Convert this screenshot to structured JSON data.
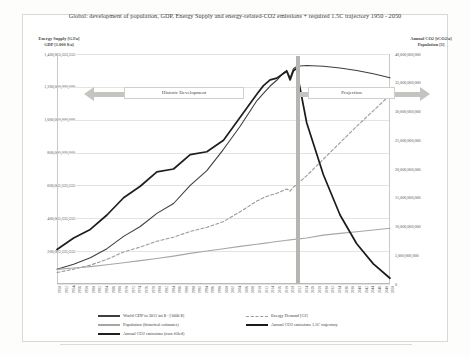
{
  "figure": {
    "title": "Global: development of population, GDP, Energy Supply and energy-related-CO2 emissions + required 1.5C trajectory 1950 - 2050",
    "axis_title_left": "Energy Supply [GJ/a]\nGDP [1.000 $/a]",
    "axis_title_left_line1": "Energy Supply [GJ/a]",
    "axis_title_left_line2": "GDP [1.000 $/a]",
    "axis_title_right_line1": "Annual CO2 [tCO2/a]",
    "axis_title_right_line2": "Population [1]"
  },
  "annotations": [
    {
      "name": "historic-development",
      "label": "Historic Development",
      "arrow": "left"
    },
    {
      "name": "projection",
      "label": "Projection",
      "arrow": "right"
    }
  ],
  "legend": {
    "items": [
      {
        "label": "World GDP in 2011 int $ - [1000 $]",
        "color": "#3f3f3f",
        "style": "solid",
        "column": 0
      },
      {
        "label": "Population (historical estimates)",
        "color": "#a6a6a3",
        "style": "solid",
        "column": 0
      },
      {
        "label": "Annual CO2 emissions (own filled)",
        "color": "#1e1e1e",
        "style": "thick",
        "column": 0
      },
      {
        "label": "Energy Demand [GJ]",
        "color": "#9a9a97",
        "style": "dashed",
        "column": 1
      },
      {
        "label": "Annual CO2 emissions 1.5C trajectory",
        "color": "#1a1a1a",
        "style": "thick",
        "column": 1
      }
    ]
  },
  "chart_data": {
    "type": "line",
    "title": "Global: development of population, GDP, Energy Supply and energy-related-CO2 emissions + required 1.5C trajectory 1950 - 2050",
    "xlabel": "",
    "ylabel": "Energy Supply [GJ/a] / GDP [1.000 $/a]",
    "y2label": "Annual CO2 [tCO2/a] / Population [1]",
    "grid": true,
    "legend_position": "bottom",
    "xlim": [
      1950,
      2050
    ],
    "ylim": [
      0,
      1400000000000
    ],
    "y2lim": [
      0,
      40000000000
    ],
    "ytick_labels": [
      "0",
      "200,000,000,000",
      "400,000,000,000",
      "600,000,000,000",
      "800,000,000,000",
      "1,000,000,000,000",
      "1,200,000,000,000",
      "1,400,000,000,000"
    ],
    "y2tick_labels": [
      "0",
      "5,000,000,000",
      "10,000,000,000",
      "15,000,000,000",
      "20,000,000,000",
      "25,000,000,000",
      "30,000,000,000",
      "35,000,000,000",
      "40,000,000,000"
    ],
    "xtick_labels": [
      "1950",
      "1952",
      "1954",
      "1956",
      "1958",
      "1960",
      "1962",
      "1964",
      "1966",
      "1968",
      "1970",
      "1972",
      "1974",
      "1976",
      "1978",
      "1980",
      "1982",
      "1984",
      "1986",
      "1988",
      "1990",
      "1992",
      "1994",
      "1996",
      "1998",
      "2000",
      "2002",
      "2004",
      "2006",
      "2008",
      "2010",
      "2012",
      "2014",
      "2016",
      "2018",
      "2020",
      "2022",
      "2024",
      "2026",
      "2028",
      "2030",
      "2032",
      "2034",
      "2036",
      "2038",
      "2040",
      "2042",
      "2044",
      "2046",
      "2048",
      "2050"
    ],
    "marker_year": 2020,
    "x": [
      1950,
      1955,
      1960,
      1965,
      1970,
      1975,
      1980,
      1985,
      1990,
      1995,
      2000,
      2005,
      2010,
      2012,
      2014,
      2016,
      2018,
      2019,
      2020,
      2021,
      2022,
      2025,
      2030,
      2035,
      2040,
      2045,
      2050
    ],
    "series": [
      {
        "name": "World GDP in 2011 int $ - [1000 $]",
        "axis": "left",
        "color": "#3f3f3f",
        "style": "solid",
        "values": [
          90000000000,
          120000000000,
          160000000000,
          215000000000,
          290000000000,
          350000000000,
          430000000000,
          490000000000,
          600000000000,
          690000000000,
          820000000000,
          960000000000,
          1115000000000,
          1160000000000,
          1205000000000,
          1240000000000,
          1285000000000,
          1300000000000,
          1255000000000,
          1310000000000,
          1325000000000,
          1330000000000,
          1325000000000,
          1315000000000,
          1300000000000,
          1280000000000,
          1255000000000
        ]
      },
      {
        "name": "Energy Demand [GJ]",
        "axis": "left",
        "color": "#9a9a97",
        "style": "dashed",
        "values": [
          70000000000,
          90000000000,
          115000000000,
          150000000000,
          195000000000,
          225000000000,
          260000000000,
          285000000000,
          320000000000,
          345000000000,
          380000000000,
          440000000000,
          505000000000,
          525000000000,
          540000000000,
          552000000000,
          570000000000,
          578000000000,
          565000000000,
          590000000000,
          605000000000,
          660000000000,
          760000000000,
          860000000000,
          960000000000,
          1055000000000,
          1150000000000
        ]
      },
      {
        "name": "Population (historical estimates)",
        "axis": "right",
        "color": "#a6a6a3",
        "style": "solid",
        "values": [
          2540000000,
          2770000000,
          3030000000,
          3340000000,
          3700000000,
          4070000000,
          4440000000,
          4850000000,
          5320000000,
          5740000000,
          6140000000,
          6540000000,
          6920000000,
          7070000000,
          7230000000,
          7380000000,
          7530000000,
          7600000000,
          7670000000,
          7740000000,
          7800000000,
          7990000000,
          8500000000,
          8800000000,
          9100000000,
          9400000000,
          9700000000
        ]
      },
      {
        "name": "Annual CO2 emissions (own filled)",
        "axis": "right",
        "color": "#1e1e1e",
        "style": "thick",
        "values": [
          6000000000,
          8000000000,
          9500000000,
          12000000000,
          15000000000,
          17000000000,
          19500000000,
          20000000000,
          22500000000,
          23000000000,
          25000000000,
          29000000000,
          33000000000,
          34500000000,
          35500000000,
          35800000000,
          36600000000,
          37000000000,
          35500000000,
          37100000000,
          37500000000,
          null,
          null,
          null,
          null,
          null,
          null
        ]
      },
      {
        "name": "Annual CO2 emissions 1.5C trajectory",
        "axis": "right",
        "color": "#1a1a1a",
        "style": "thick",
        "values": [
          null,
          null,
          null,
          null,
          null,
          null,
          null,
          null,
          null,
          null,
          null,
          null,
          null,
          null,
          null,
          null,
          null,
          null,
          null,
          null,
          37000000000,
          28000000000,
          19000000000,
          12000000000,
          7000000000,
          3500000000,
          1000000000
        ]
      }
    ]
  }
}
